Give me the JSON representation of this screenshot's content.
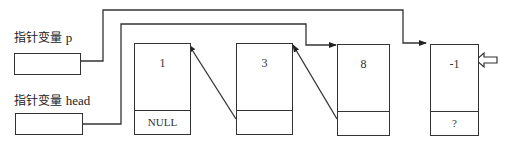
{
  "diagram": {
    "type": "linked-list-insertion",
    "pointers": [
      {
        "id": "p",
        "label_cn": "指针变量",
        "label_var": "p"
      },
      {
        "id": "head",
        "label_cn": "指针变量",
        "label_var": "head"
      }
    ],
    "nodes": [
      {
        "data": "1",
        "next": "NULL"
      },
      {
        "data": "3",
        "next": ""
      },
      {
        "data": "8",
        "next": ""
      },
      {
        "data": "-1",
        "next": "?"
      }
    ],
    "edges": [
      {
        "from": "p",
        "to": "node-3",
        "note": "p points to new node -1"
      },
      {
        "from": "head",
        "to": "node-2",
        "note": "head points to node 8"
      },
      {
        "from": "node-2.next",
        "to": "node-1"
      },
      {
        "from": "node-1.next",
        "to": "node-0"
      }
    ],
    "indicator": {
      "type": "hollow-arrow",
      "target": "node-3",
      "direction": "left"
    },
    "colors": {
      "line": "#333333",
      "background": "#ffffff"
    }
  }
}
